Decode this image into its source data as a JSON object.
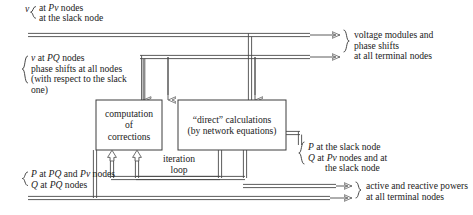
{
  "diagram": {
    "line_color": "#4a4a4a",
    "box_border_color": "#3d3d3d",
    "text_color": "#222222"
  },
  "inputs": {
    "top_left": {
      "brace_var": "v",
      "lines": [
        "at Pv nodes",
        "at the slack node"
      ]
    },
    "mid_left": {
      "lines": [
        "v at PQ nodes",
        "phase shifts at all nodes",
        "(with respect to the slack",
        "one)"
      ]
    },
    "bottom_left": {
      "lines": [
        "P at PQ and Pv nodes",
        "Q at PQ nodes"
      ]
    }
  },
  "blocks": {
    "corrections": {
      "lines": [
        "computation",
        "of",
        "corrections"
      ]
    },
    "direct": {
      "lines": [
        "“direct” calculations",
        "(by network equations)"
      ]
    },
    "loop": {
      "lines": [
        "iteration",
        "loop"
      ]
    }
  },
  "outputs": {
    "top_right": {
      "lines": [
        "voltage modules and",
        "phase shifts",
        "at all terminal nodes"
      ]
    },
    "mid_right": {
      "lines": [
        "P   at the slack node",
        "Q   at Pv nodes and at",
        "the slack node"
      ]
    },
    "bottom_right": {
      "lines": [
        "active and reactive powers",
        "at all terminal nodes"
      ]
    }
  }
}
